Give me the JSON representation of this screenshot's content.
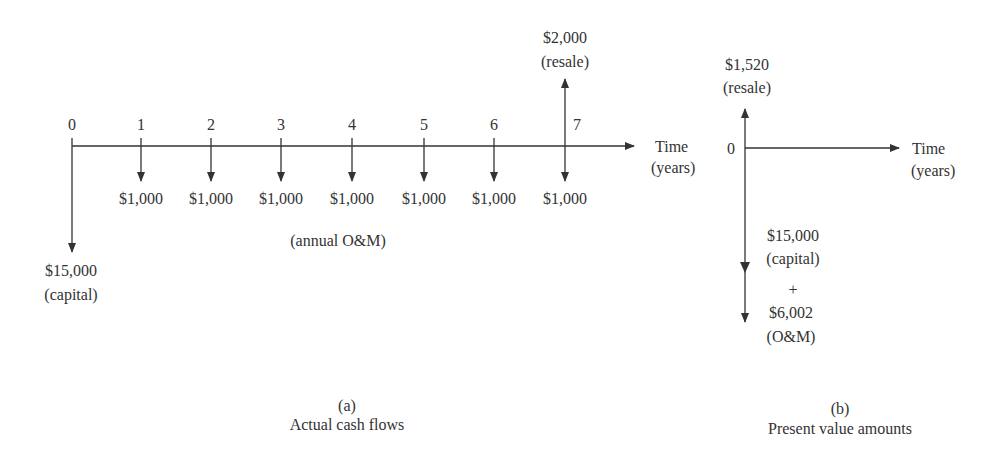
{
  "panel_a": {
    "caption_letter": "(a)",
    "caption_title": "Actual cash flows",
    "axis_label_line1": "Time",
    "axis_label_line2": "(years)",
    "ticks": [
      "0",
      "1",
      "2",
      "3",
      "4",
      "5",
      "6",
      "7"
    ],
    "annual_amounts": [
      "$1,000",
      "$1,000",
      "$1,000",
      "$1,000",
      "$1,000",
      "$1,000",
      "$1,000"
    ],
    "annual_label": "(annual O&M)",
    "capital_amount": "$15,000",
    "capital_label": "(capital)",
    "resale_amount": "$2,000",
    "resale_label": "(resale)"
  },
  "panel_b": {
    "caption_letter": "(b)",
    "caption_title": "Present value amounts",
    "origin_tick": "0",
    "axis_label_line1": "Time",
    "axis_label_line2": "(years)",
    "resale_amount": "$1,520",
    "resale_label": "(resale)",
    "capital_amount": "$15,000",
    "capital_label": "(capital)",
    "plus": "+",
    "om_amount": "$6,002",
    "om_label": "(O&M)"
  },
  "colors": {
    "ink": "#333333",
    "background": "#ffffff"
  }
}
